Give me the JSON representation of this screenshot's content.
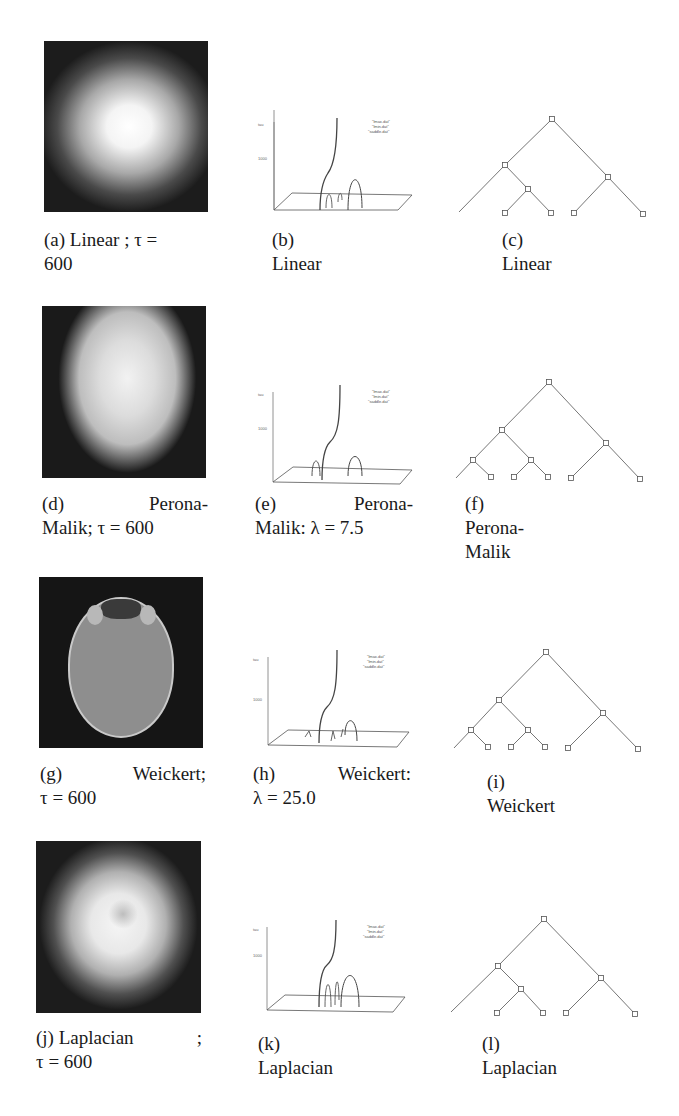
{
  "rows": [
    {
      "image": {
        "caption_line1_left": "(a) Linear ; τ =",
        "caption_line1_right": "",
        "caption_line2": "600",
        "kind": "linear"
      },
      "plot": {
        "caption_line1_left": "(b) Linear",
        "caption_line1_right": "",
        "caption_line2": ""
      },
      "tree": {
        "caption": "(c) Linear"
      }
    },
    {
      "image": {
        "caption_line1_left": "(d)",
        "caption_line1_right": "Perona-",
        "caption_line2": "Malik; τ = 600",
        "kind": "perona"
      },
      "plot": {
        "caption_line1_left": "(e)",
        "caption_line1_right": "Perona-",
        "caption_line2": "Malik: λ = 7.5"
      },
      "tree": {
        "caption": "(f) Perona-Malik"
      }
    },
    {
      "image": {
        "caption_line1_left": "(g)",
        "caption_line1_right": "Weickert;",
        "caption_line2": "τ = 600",
        "kind": "weickert"
      },
      "plot": {
        "caption_line1_left": "(h)",
        "caption_line1_right": "Weickert:",
        "caption_line2": "λ = 25.0"
      },
      "tree": {
        "caption": "(i) Weickert"
      }
    },
    {
      "image": {
        "caption_line1_left": "(j) Laplacian",
        "caption_line1_right": ";",
        "caption_line2": "τ = 600",
        "kind": "laplacian"
      },
      "plot": {
        "caption_line1_left": "(k) Laplacian",
        "caption_line1_right": "",
        "caption_line2": ""
      },
      "tree": {
        "caption": "(l) Laplacian"
      }
    }
  ],
  "plot_common": {
    "axis_label": "tau",
    "tick_label": "1000",
    "legend": [
      "\"lmax.dat\"",
      "\"lmin.dat\"",
      "\"saddle.dat\""
    ]
  }
}
